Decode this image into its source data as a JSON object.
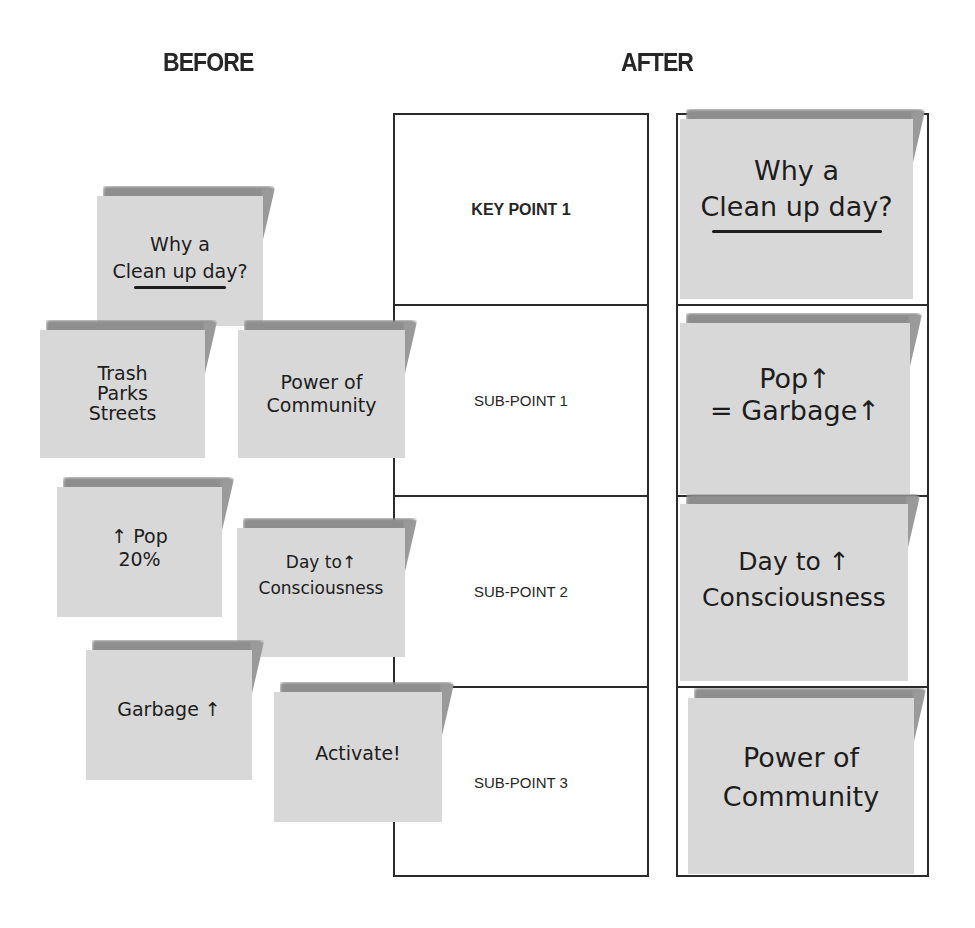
{
  "headings": {
    "before": "BEFORE",
    "after": "AFTER"
  },
  "before_notes": [
    {
      "id": "why-cleanup",
      "lines": [
        "Why a",
        "Clean up day?"
      ],
      "underlined": true
    },
    {
      "id": "trash-parks-streets",
      "lines": [
        "Trash",
        "Parks",
        "Streets"
      ]
    },
    {
      "id": "power-of-community",
      "lines": [
        "Power of",
        "Community"
      ]
    },
    {
      "id": "pop-20",
      "lines": [
        "↑ Pop",
        "20%"
      ]
    },
    {
      "id": "day-to-consciousness",
      "lines": [
        "Day to↑",
        "Consciousness"
      ]
    },
    {
      "id": "garbage-up",
      "lines": [
        "Garbage ↑"
      ]
    },
    {
      "id": "activate",
      "lines": [
        "Activate!"
      ]
    }
  ],
  "structure_table": {
    "rows": [
      {
        "label": "KEY POINT 1",
        "kind": "key"
      },
      {
        "label": "SUB-POINT 1",
        "kind": "sub"
      },
      {
        "label": "SUB-POINT 2",
        "kind": "sub"
      },
      {
        "label": "SUB-POINT 3",
        "kind": "sub"
      }
    ]
  },
  "after_notes": [
    {
      "id": "why-cleanup",
      "lines": [
        "Why a",
        "Clean up day?"
      ],
      "underlined": true
    },
    {
      "id": "pop-garbage",
      "lines": [
        "Pop↑",
        "= Garbage↑"
      ]
    },
    {
      "id": "day-to-consciousness",
      "lines": [
        "Day to ↑",
        "Consciousness"
      ]
    },
    {
      "id": "power-of-community",
      "lines": [
        "Power of",
        "Community"
      ]
    }
  ],
  "colors": {
    "note_fill": "#d8d8d8",
    "note_shadow": "#8e8e8e",
    "ink": "#1d1d1d",
    "line": "#2a2a2a"
  }
}
